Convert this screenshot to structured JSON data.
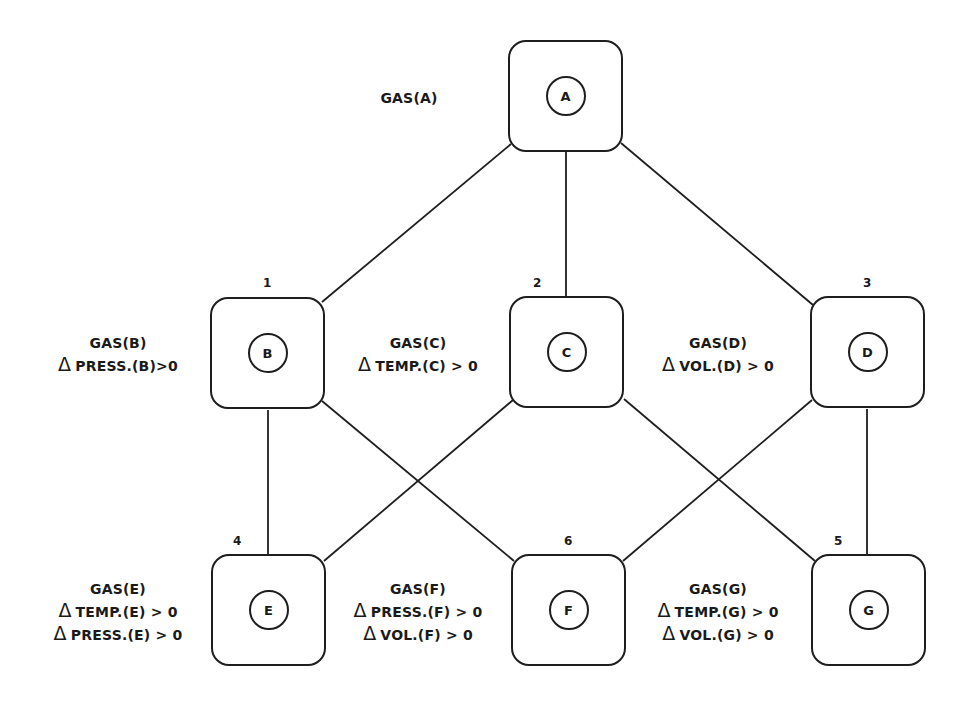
{
  "diagram": {
    "type": "lattice",
    "nodes": [
      {
        "id": "A",
        "label": "A",
        "number": "",
        "conditions": [
          "GAS(A)"
        ]
      },
      {
        "id": "B",
        "label": "B",
        "number": "1",
        "conditions": [
          "GAS(B)",
          "PRESS.(B)>0"
        ]
      },
      {
        "id": "C",
        "label": "C",
        "number": "2",
        "conditions": [
          "GAS(C)",
          "TEMP.(C) > 0"
        ]
      },
      {
        "id": "D",
        "label": "D",
        "number": "3",
        "conditions": [
          "GAS(D)",
          "VOL.(D) > 0"
        ]
      },
      {
        "id": "E",
        "label": "E",
        "number": "4",
        "conditions": [
          "GAS(E)",
          "TEMP.(E) > 0",
          "PRESS.(E) > 0"
        ]
      },
      {
        "id": "F",
        "label": "F",
        "number": "6",
        "conditions": [
          "GAS(F)",
          "PRESS.(F) > 0",
          "VOL.(F) > 0"
        ]
      },
      {
        "id": "G",
        "label": "G",
        "number": "5",
        "conditions": [
          "GAS(G)",
          "TEMP.(G) > 0",
          "VOL.(G) > 0"
        ]
      }
    ],
    "edges": [
      [
        "A",
        "B"
      ],
      [
        "A",
        "C"
      ],
      [
        "A",
        "D"
      ],
      [
        "B",
        "E"
      ],
      [
        "B",
        "F"
      ],
      [
        "C",
        "E"
      ],
      [
        "C",
        "G"
      ],
      [
        "D",
        "F"
      ],
      [
        "D",
        "G"
      ]
    ],
    "delta_symbol": "Δ"
  },
  "labels": {
    "A": {
      "circle": "A",
      "gas": "GAS(A)"
    },
    "B": {
      "circle": "B",
      "num": "1",
      "gas": "GAS(B)",
      "c1": "PRESS.(B)>0"
    },
    "C": {
      "circle": "C",
      "num": "2",
      "gas": "GAS(C)",
      "c1": "TEMP.(C) > 0"
    },
    "D": {
      "circle": "D",
      "num": "3",
      "gas": "GAS(D)",
      "c1": "VOL.(D) > 0"
    },
    "E": {
      "circle": "E",
      "num": "4",
      "gas": "GAS(E)",
      "c1": "TEMP.(E) > 0",
      "c2": "PRESS.(E) > 0"
    },
    "F": {
      "circle": "F",
      "num": "6",
      "gas": "GAS(F)",
      "c1": "PRESS.(F) > 0",
      "c2": "VOL.(F) > 0"
    },
    "G": {
      "circle": "G",
      "num": "5",
      "gas": "GAS(G)",
      "c1": "TEMP.(G) > 0",
      "c2": "VOL.(G) > 0"
    },
    "delta": "Δ"
  }
}
